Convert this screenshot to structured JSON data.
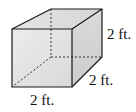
{
  "figure": {
    "type": "cube",
    "edge_length": 2,
    "unit": "ft.",
    "labels": {
      "height": "2 ft.",
      "depth": "2 ft.",
      "width": "2 ft."
    },
    "colors": {
      "edge": "#1a1a1a",
      "hidden_edge": "#333333",
      "front_face": "#e6e6e6",
      "top_face": "#dcdcdc",
      "side_face": "#d2d2d2",
      "background": "#ffffff"
    }
  }
}
